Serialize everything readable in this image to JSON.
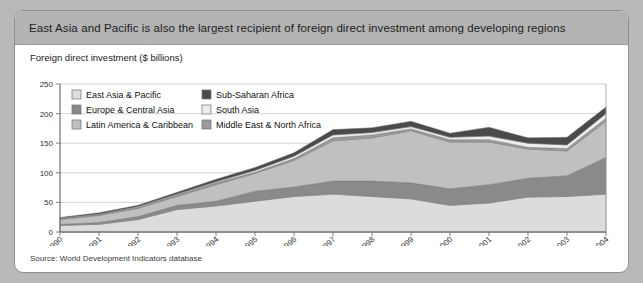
{
  "header": {
    "title": "East Asia and Pacific is also the largest recipient of foreign direct investment among developing regions",
    "bar_color": "#b3b3b3"
  },
  "axis_title": "Foreign direct investment ($ billions)",
  "source": "Source: World Development Indicators database",
  "chart_data": {
    "type": "area",
    "stacked": true,
    "title": "Foreign direct investment ($ billions)",
    "xlabel": "",
    "ylabel": "",
    "ylim": [
      0,
      250
    ],
    "yticks": [
      0,
      50,
      100,
      150,
      200,
      250
    ],
    "grid": true,
    "legend_position": "top-left-inside",
    "categories": [
      "1990",
      "1991",
      "1992",
      "1993",
      "1994",
      "1995",
      "1996",
      "1997",
      "1998",
      "1999",
      "2000",
      "2001",
      "2002",
      "2003",
      "2004"
    ],
    "series": [
      {
        "name": "East Asia & Pacific",
        "color": "#dcdcdc",
        "values": [
          11,
          13,
          21,
          38,
          44,
          52,
          60,
          64,
          60,
          56,
          45,
          49,
          59,
          60,
          64
        ]
      },
      {
        "name": "Europe & Central Asia",
        "color": "#8a8a8a",
        "values": [
          2,
          3,
          5,
          7,
          8,
          17,
          16,
          22,
          26,
          27,
          28,
          31,
          32,
          35,
          62
        ]
      },
      {
        "name": "Latin America & Caribbean",
        "color": "#c0c0c0",
        "values": [
          8,
          12,
          14,
          15,
          28,
          30,
          45,
          68,
          73,
          88,
          79,
          72,
          49,
          42,
          61
        ]
      },
      {
        "name": "Middle East & North Africa",
        "color": "#9c9c9c",
        "values": [
          2,
          2,
          2,
          3,
          3,
          2,
          3,
          5,
          5,
          3,
          4,
          4,
          3,
          4,
          5
        ]
      },
      {
        "name": "South Asia",
        "color": "#ededed",
        "values": [
          0.5,
          0.5,
          1,
          1,
          2,
          3,
          4,
          5,
          4,
          4,
          4,
          6,
          7,
          6,
          8
        ]
      },
      {
        "name": "Sub-Saharan Africa",
        "color": "#4a4a4a",
        "values": [
          1,
          2,
          2,
          3,
          4,
          5,
          6,
          9,
          8,
          9,
          7,
          15,
          9,
          13,
          11
        ]
      }
    ],
    "totals": [
      24.5,
      32.5,
      45,
      67,
      89,
      109,
      134,
      173,
      176,
      187,
      167,
      177,
      159,
      160,
      211
    ]
  },
  "legend": {
    "items": [
      {
        "label": "East Asia & Pacific",
        "color": "#dcdcdc"
      },
      {
        "label": "Europe & Central Asia",
        "color": "#8a8a8a"
      },
      {
        "label": "Latin America & Caribbean",
        "color": "#c0c0c0"
      },
      {
        "label": "Sub-Saharan Africa",
        "color": "#4a4a4a"
      },
      {
        "label": "South Asia",
        "color": "#ededed"
      },
      {
        "label": "Middle East & North Africa",
        "color": "#9c9c9c"
      }
    ]
  }
}
